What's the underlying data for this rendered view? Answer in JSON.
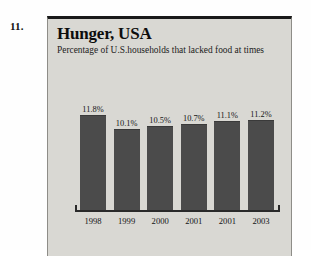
{
  "question_number": "11.",
  "panel": {
    "title": "Hunger, USA",
    "subtitle": "Percentage of U.S.households that lacked food at times"
  },
  "colors": {
    "bar": "#4b4b4b",
    "panel_background": "#d9d8d3",
    "axis": "#2a2a2a",
    "text": "#101010"
  },
  "chart_data": {
    "type": "bar",
    "title": "Hunger, USA",
    "subtitle": "Percentage of U.S.households that lacked food at times",
    "xlabel": "",
    "ylabel": "",
    "categories": [
      "1998",
      "1999",
      "2000",
      "2001",
      "2001",
      "2003"
    ],
    "values": [
      11.8,
      10.1,
      10.5,
      10.7,
      11.1,
      11.2
    ],
    "data_labels": [
      "11.8%",
      "10.1%",
      "10.5%",
      "10.7%",
      "11.1%",
      "11.2%"
    ],
    "ylim": [
      0,
      12.8
    ],
    "grid": false,
    "legend": "none",
    "axis_visible": {
      "x": true,
      "y": false
    }
  }
}
